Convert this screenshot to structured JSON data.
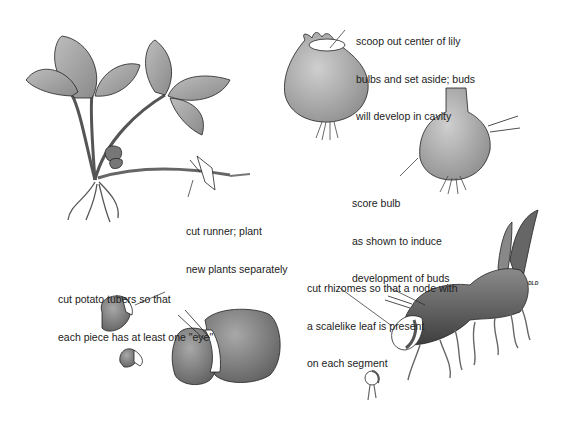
{
  "figure": {
    "panels": [
      {
        "id": "runner",
        "subject": "plant with runner",
        "label_lines": [
          "cut runner; plant",
          "new plants separately"
        ]
      },
      {
        "id": "lily-scoop",
        "subject": "lily bulb with scooped center",
        "label_lines": [
          "scoop out center of lily",
          "bulbs and set aside; buds",
          "will develop in cavity"
        ]
      },
      {
        "id": "bulb-score",
        "subject": "scored bulb",
        "label_lines": [
          "score bulb",
          "as shown to induce",
          "development of buds"
        ]
      },
      {
        "id": "potato",
        "subject": "potato tubers",
        "label_lines": [
          "cut potato tubers so that",
          "each piece has at least one \"eye\""
        ]
      },
      {
        "id": "rhizome",
        "subject": "rhizome",
        "label_lines": [
          "cut rhizomes so that a node with",
          "a scalelike leaf is present",
          "on each segment"
        ]
      }
    ],
    "artist_signature": "DLD",
    "colors": {
      "background": "#ffffff",
      "fill_gray": "#9a9a9a",
      "fill_dark": "#6e6e6e",
      "line": "#222222"
    }
  }
}
